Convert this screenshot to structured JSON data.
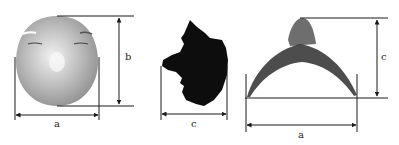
{
  "figure": {
    "panels": [
      {
        "id": "frontal-face",
        "dimensions": [
          {
            "label": "a",
            "orientation": "horizontal"
          },
          {
            "label": "b",
            "orientation": "vertical"
          }
        ]
      },
      {
        "id": "side-profile",
        "dimensions": [
          {
            "label": "c",
            "orientation": "horizontal"
          }
        ]
      },
      {
        "id": "top-cross-section",
        "dimensions": [
          {
            "label": "a",
            "orientation": "horizontal"
          },
          {
            "label": "c",
            "orientation": "vertical"
          }
        ]
      }
    ],
    "labels": {
      "front_a": "a",
      "front_b": "b",
      "side_c": "c",
      "top_a": "a",
      "top_c": "c"
    },
    "colors": {
      "line": "#1a1a1a",
      "face_light": "#e6e6e6",
      "face_mid": "#a9a9a9",
      "silhouette": "#0d0d0d",
      "point_cloud": "#333333"
    }
  }
}
